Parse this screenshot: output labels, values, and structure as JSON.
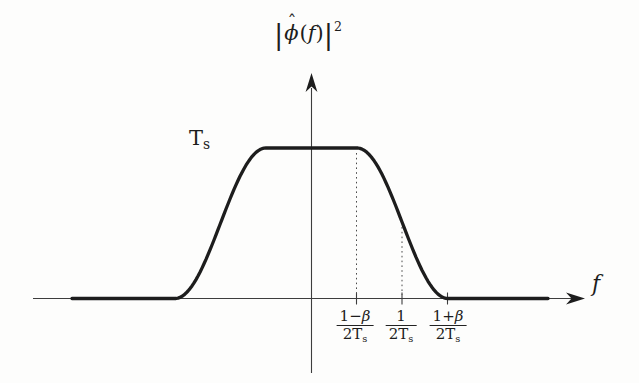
{
  "figure": {
    "background": "#fdfdfc",
    "curve_color": "#1d1d1d",
    "axis_color": "#3d3d3d",
    "guide_color": "#4a4a4a"
  },
  "labels": {
    "title": {
      "lbar": "|",
      "hat": "ˆ",
      "phi": "ϕ",
      "lparen": "(",
      "fvar": "f",
      "rparen": ")",
      "rbar": "|",
      "sup": "2"
    },
    "peak": {
      "base": "T",
      "sub": "s"
    },
    "x_axis": "f"
  },
  "ticks": [
    {
      "num_pre": "1−",
      "num_var": "β",
      "den": "2T",
      "den_sub": "s"
    },
    {
      "num_pre": "1",
      "num_var": "",
      "den": "2T",
      "den_sub": "s"
    },
    {
      "num_pre": "1+",
      "num_var": "β",
      "den": "2T",
      "den_sub": "s"
    }
  ],
  "chart_data": {
    "type": "line",
    "xlabel": "f",
    "ylabel": "",
    "curve_description": "Squared magnitude of a raised-cosine (Nyquist) pulse spectrum: flat top of height Ts for |f| ≤ (1−β)/2Ts, cosine roll-off to 0 at |f| = (1+β)/2Ts, zero beyond",
    "peak_value": "Ts",
    "rolloff_beta_estimate": 0.5,
    "x_tick_labels": [
      "(1−β)/2Ts",
      "1/2Ts",
      "(1+β)/2Ts"
    ],
    "key_points": [
      {
        "f": "−(1+β)/2Ts",
        "value": "0"
      },
      {
        "f": "−(1−β)/2Ts",
        "value": "Ts"
      },
      {
        "f": "0",
        "value": "Ts"
      },
      {
        "f": "(1−β)/2Ts",
        "value": "Ts"
      },
      {
        "f": "1/2Ts",
        "value": "Ts/2"
      },
      {
        "f": "(1+β)/2Ts",
        "value": "0"
      }
    ],
    "legend": null,
    "grid": false,
    "render": {
      "x0": 311.5,
      "px_per_unit": 91,
      "y_zero": 298.5,
      "y_peak": 148,
      "beta": 0.5,
      "x_start": 72,
      "x_end": 548
    }
  }
}
